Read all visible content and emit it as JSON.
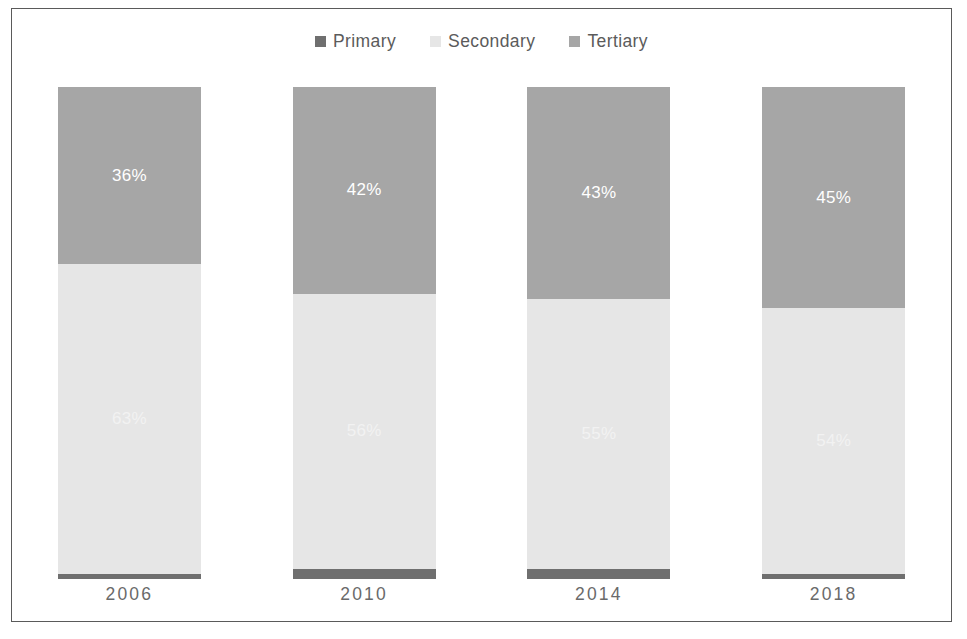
{
  "chart_data": {
    "type": "bar",
    "title": "",
    "subtitle": "",
    "xlabel": "",
    "ylabel": "",
    "ylim": [
      0,
      100
    ],
    "stacked": true,
    "normalized_percent": true,
    "grid": false,
    "legend_position": "top-center",
    "categories": [
      "2006",
      "2010",
      "2014",
      "2018"
    ],
    "series": [
      {
        "name": "Primary",
        "color": "#6f6f6f",
        "values": [
          1,
          2,
          2,
          1
        ],
        "labels": [
          "",
          "",
          "",
          ""
        ]
      },
      {
        "name": "Secondary",
        "color": "#e6e6e6",
        "values": [
          63,
          56,
          55,
          54
        ],
        "labels": [
          "63%",
          "56%",
          "55%",
          "54%"
        ]
      },
      {
        "name": "Tertiary",
        "color": "#a6a6a6",
        "values": [
          36,
          42,
          43,
          45
        ],
        "labels": [
          "36%",
          "42%",
          "43%",
          "45%"
        ]
      }
    ]
  },
  "legend": {
    "entries": [
      {
        "label": "Primary",
        "color": "#6f6f6f"
      },
      {
        "label": "Secondary",
        "color": "#e6e6e6"
      },
      {
        "label": "Tertiary",
        "color": "#a6a6a6"
      }
    ]
  },
  "colors": {
    "border": "#5a5a5a",
    "background": "#ffffff",
    "axis_text": "#6a6a6a",
    "legend_text": "#5b5b5b",
    "data_label": "#ffffff"
  }
}
